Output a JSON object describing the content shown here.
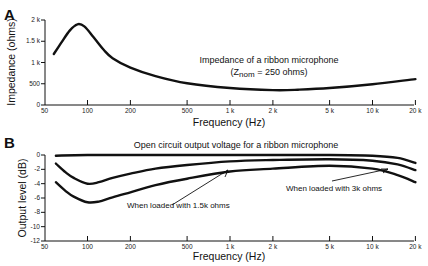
{
  "chart_data": [
    {
      "panel": "A",
      "type": "line",
      "title": "Impedance of a ribbon microphone",
      "subtitle": "(Z_nom = 250 ohms)",
      "subtitle_main": "(Z",
      "subtitle_sub": "nom",
      "subtitle_rest": " = 250 ohms)",
      "xlabel": "Frequency (Hz)",
      "ylabel": "Impedance (ohms)",
      "xscale": "log",
      "xlim": [
        50,
        20000
      ],
      "ylim": [
        0,
        2000
      ],
      "grid": false,
      "x_ticks": [
        {
          "value": 50,
          "label": "50"
        },
        {
          "value": 100,
          "label": "100"
        },
        {
          "value": 200,
          "label": "200"
        },
        {
          "value": 500,
          "label": "500"
        },
        {
          "value": 1000,
          "label": "1 k"
        },
        {
          "value": 2000,
          "label": "2 k"
        },
        {
          "value": 5000,
          "label": "5 k"
        },
        {
          "value": 10000,
          "label": "10 k"
        },
        {
          "value": 20000,
          "label": "20 k"
        }
      ],
      "y_ticks": [
        {
          "value": 0,
          "label": "0"
        },
        {
          "value": 500,
          "label": "500"
        },
        {
          "value": 1000,
          "label": "1 k"
        },
        {
          "value": 1500,
          "label": "1.5 k"
        },
        {
          "value": 2000,
          "label": "2 k"
        }
      ],
      "series": [
        {
          "name": "Impedance",
          "x": [
            58,
            65,
            75,
            85,
            95,
            110,
            130,
            150,
            200,
            300,
            500,
            1000,
            2000,
            3000,
            5000,
            10000,
            20000
          ],
          "values": [
            1200,
            1450,
            1750,
            1900,
            1850,
            1600,
            1300,
            1100,
            880,
            680,
            510,
            400,
            350,
            360,
            400,
            490,
            610
          ]
        }
      ]
    },
    {
      "panel": "B",
      "type": "line",
      "title": "Open circuit output voltage for a ribbon microphone",
      "xlabel": "Frequency (Hz)",
      "ylabel": "Output level (dB)",
      "xscale": "log",
      "xlim": [
        50,
        20000
      ],
      "ylim": [
        -12,
        0
      ],
      "grid": false,
      "x_ticks": [
        {
          "value": 50,
          "label": "50"
        },
        {
          "value": 100,
          "label": "100"
        },
        {
          "value": 200,
          "label": "200"
        },
        {
          "value": 500,
          "label": "500"
        },
        {
          "value": 1000,
          "label": "1 k"
        },
        {
          "value": 2000,
          "label": "2 k"
        },
        {
          "value": 5000,
          "label": "5 k"
        },
        {
          "value": 10000,
          "label": "10 k"
        },
        {
          "value": 20000,
          "label": "20 k"
        }
      ],
      "y_ticks": [
        {
          "value": 0,
          "label": "0"
        },
        {
          "value": -2,
          "label": "-2"
        },
        {
          "value": -4,
          "label": "-4"
        },
        {
          "value": -6,
          "label": "-6"
        },
        {
          "value": -8,
          "label": "-8"
        },
        {
          "value": -10,
          "label": "-10"
        },
        {
          "value": -12,
          "label": "-12"
        }
      ],
      "series": [
        {
          "name": "Open circuit",
          "x": [
            60,
            100,
            300,
            1000,
            5000,
            10000,
            15000,
            20000
          ],
          "values": [
            -0.1,
            0,
            0,
            0,
            0,
            -0.1,
            -0.4,
            -1.1
          ]
        },
        {
          "name": "When loaded with 3k ohms",
          "x": [
            60,
            70,
            80,
            100,
            120,
            150,
            200,
            300,
            500,
            1000,
            2000,
            5000,
            10000,
            15000,
            20000
          ],
          "values": [
            -1.2,
            -2.4,
            -3.2,
            -4.0,
            -3.8,
            -3.2,
            -2.6,
            -1.9,
            -1.4,
            -0.9,
            -0.7,
            -0.6,
            -0.8,
            -1.3,
            -2.1
          ]
        },
        {
          "name": "When loaded with 1.5k ohms",
          "x": [
            60,
            70,
            80,
            100,
            120,
            150,
            200,
            300,
            500,
            1000,
            2000,
            5000,
            10000,
            15000,
            20000
          ],
          "values": [
            -3.8,
            -5.0,
            -5.8,
            -6.6,
            -6.5,
            -5.9,
            -5.2,
            -4.2,
            -3.3,
            -2.3,
            -1.9,
            -1.5,
            -1.9,
            -2.8,
            -3.8
          ]
        }
      ],
      "annotations": [
        {
          "text": "When loaded with 1.5k ohms",
          "target_series": "When loaded with 1.5k ohms",
          "arrow_to_hz": 1000
        },
        {
          "text": "When loaded with 3k ohms",
          "target_series": "When loaded with 3k ohms",
          "arrow_to_hz": 13000
        }
      ]
    }
  ]
}
